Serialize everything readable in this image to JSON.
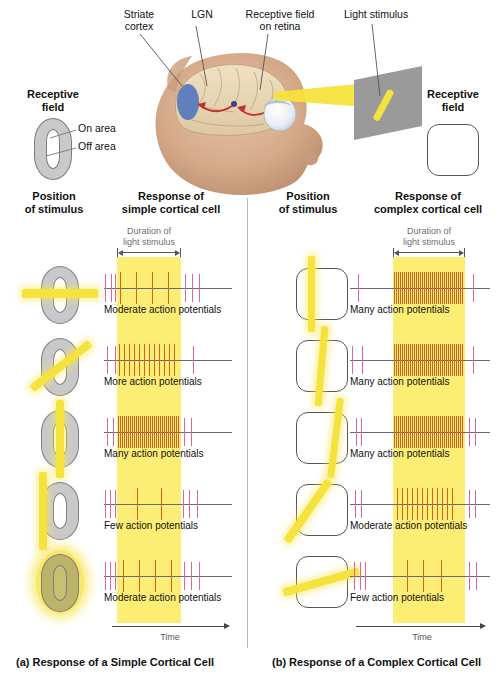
{
  "figure": {
    "top_labels": {
      "striate_cortex": "Striate\ncortex",
      "striate_cortex_l1": "Striate",
      "striate_cortex_l2": "cortex",
      "lgn": "LGN",
      "receptive_field_retina_l1": "Receptive field",
      "receptive_field_retina_l2": "on retina",
      "light_stimulus": "Light stimulus"
    },
    "legend_left": {
      "title_l1": "Receptive",
      "title_l2": "field",
      "on_area": "On area",
      "off_area": "Off area"
    },
    "legend_right": {
      "title_l1": "Receptive",
      "title_l2": "field"
    },
    "colors": {
      "stimulus_yellow": "#f5e23c",
      "band_yellow": "#fbea55",
      "spike_outside": "#e0659a",
      "spike_inside": "#d2621f",
      "axis_gray": "#6b6b78",
      "striate_blue": "#5577bd",
      "arrow_red": "#c0312b",
      "screen_gray": "#9a9a9a"
    }
  },
  "panels": [
    {
      "id": "simple",
      "caption": "(a) Response of a Simple Cortical Cell",
      "col_position_l1": "Position",
      "col_position_l2": "of stimulus",
      "col_response_l1": "Response of",
      "col_response_l2": "simple cortical cell",
      "duration_l1": "Duration of",
      "duration_l2": "light stimulus",
      "time_label": "Time",
      "rows": [
        {
          "stimulus": "horizontal-bar-across-center",
          "result": "Moderate action potentials",
          "spikes_before": [
            0,
            7,
            14
          ],
          "spikes_during": [
            3,
            19,
            35,
            51
          ],
          "spikes_after": [
            4,
            11,
            18
          ]
        },
        {
          "stimulus": "diagonal-bar-45deg",
          "result": "More action potentials",
          "spikes_before": [
            3,
            12
          ],
          "spikes_during": [
            2,
            7,
            12,
            17,
            22,
            27,
            32,
            37,
            42,
            47,
            52,
            57
          ],
          "spikes_after": [
            12
          ]
        },
        {
          "stimulus": "vertical-bar-on-area",
          "result": "Many action potentials",
          "spikes_before": [
            3,
            9
          ],
          "spikes_during": [
            1,
            3,
            5,
            7,
            9,
            11,
            13,
            15,
            17,
            19,
            21,
            23,
            25,
            27,
            29,
            31,
            33,
            35,
            37,
            39,
            41,
            43,
            45,
            47,
            49,
            51,
            53,
            55,
            57,
            59,
            61
          ],
          "spikes_after": [
            3,
            10
          ]
        },
        {
          "stimulus": "vertical-bar-left-off-area",
          "result": "Few action potentials",
          "spikes_before": [
            1,
            6,
            11,
            16
          ],
          "spikes_during": [
            20,
            44
          ],
          "spikes_after": [
            2,
            8,
            16
          ]
        },
        {
          "stimulus": "full-field-illumination",
          "result": "Moderate action potentials",
          "spikes_before": [
            1,
            6,
            11,
            16
          ],
          "spikes_during": [
            6,
            22,
            38,
            54
          ],
          "spikes_after": [
            3,
            10,
            18
          ]
        }
      ]
    },
    {
      "id": "complex",
      "caption": "(b) Response of a Complex Cortical Cell",
      "col_position_l1": "Position",
      "col_position_l2": "of stimulus",
      "col_response_l1": "Response of",
      "col_response_l2": "complex cortical cell",
      "duration_l1": "Duration of",
      "duration_l2": "light stimulus",
      "time_label": "Time",
      "rows": [
        {
          "stimulus": "vertical-bar-left",
          "result": "Many action potentials",
          "spikes_before": [
            8
          ],
          "spikes_during": [
            1,
            3,
            5,
            7,
            9,
            11,
            13,
            15,
            17,
            19,
            21,
            23,
            25,
            27,
            29,
            31,
            33,
            35,
            37,
            39,
            41,
            43,
            45,
            47,
            49,
            51,
            53,
            55,
            57,
            59,
            61,
            63,
            65,
            67,
            69
          ],
          "spikes_after": [
            8
          ]
        },
        {
          "stimulus": "vertical-bar-center",
          "result": "Many action potentials",
          "spikes_before": [
            2,
            12
          ],
          "spikes_during": [
            1,
            3,
            5,
            7,
            9,
            11,
            13,
            15,
            17,
            19,
            21,
            23,
            25,
            27,
            29,
            31,
            33,
            35,
            37,
            39,
            41,
            43,
            45,
            47,
            49,
            51,
            53,
            55,
            57,
            59,
            61,
            63,
            65,
            67,
            69
          ],
          "spikes_after": [
            8
          ]
        },
        {
          "stimulus": "vertical-bar-right-tilted",
          "result": "Many action potentials",
          "spikes_before": [
            6,
            11
          ],
          "spikes_during": [
            1,
            3,
            5,
            7,
            9,
            11,
            13,
            15,
            17,
            19,
            21,
            23,
            25,
            27,
            29,
            31,
            33,
            35,
            37,
            39,
            41,
            43,
            45,
            47,
            49,
            51,
            53,
            55,
            57,
            59,
            61,
            63,
            65,
            67,
            69
          ],
          "spikes_after": [
            4,
            10
          ]
        },
        {
          "stimulus": "diagonal-bar-steep",
          "result": "Moderate action potentials",
          "spikes_before": [
            5,
            11
          ],
          "spikes_during": [
            4,
            9,
            14,
            19,
            24,
            29,
            34,
            39,
            44,
            49,
            54,
            59
          ],
          "spikes_after": [
            4,
            10
          ]
        },
        {
          "stimulus": "diagonal-bar-shallow",
          "result": "Few action potentials",
          "spikes_before": [
            4,
            10,
            15
          ],
          "spikes_during": [
            14,
            30,
            48
          ],
          "spikes_after": [
            4,
            11
          ]
        }
      ]
    }
  ]
}
